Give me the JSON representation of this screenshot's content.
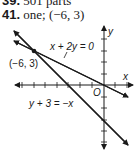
{
  "previous_answer": {
    "number": "39.",
    "text": "501 parts"
  },
  "answer": {
    "number": "41.",
    "text": "one; (−6, 3)"
  },
  "graph": {
    "x_axis_label": "x",
    "y_axis_label": "y",
    "origin_label": "O",
    "point_label": "(−6, 3)",
    "line1_label": "x + 2y = 0",
    "line2_label": "y + 3 = −x",
    "colors": {
      "ink": "#1a1a1a",
      "background": "#ffffff"
    }
  }
}
